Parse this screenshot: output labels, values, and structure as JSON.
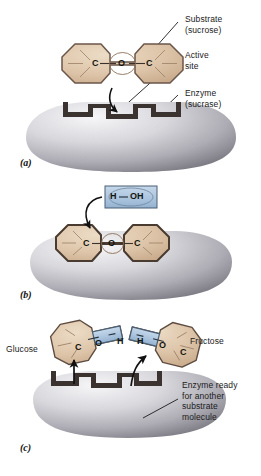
{
  "figure": {
    "background_color": "#ffffff"
  },
  "colors": {
    "substrate_tan": "#dcc2a6",
    "substrate_tan_light": "#e8d6be",
    "substrate_outline": "#6b564a",
    "water_blue": "#a9c3dd",
    "water_blue_light": "#c3d6e9",
    "water_outline": "#4a5f74",
    "enzyme_light": "#f2f1f3",
    "enzyme_mid": "#bdbcc2",
    "enzyme_dark": "#87868e",
    "active_site_dark": "#3a3330",
    "text": "#1b1b1b",
    "arrow": "#111111"
  },
  "panels": [
    {
      "id": "a",
      "tag": "(a)",
      "labels": [
        {
          "name": "substrate",
          "line1": "Substrate",
          "line2": "(sucrose)"
        },
        {
          "name": "active-site",
          "line1": "Active",
          "line2": "site"
        },
        {
          "name": "enzyme",
          "line1": "Enzyme",
          "line2": "(sucrase)"
        }
      ],
      "molecule": {
        "name": "sucrose",
        "atoms": [
          "C",
          "O",
          "C"
        ],
        "rings": 2
      }
    },
    {
      "id": "b",
      "tag": "(b)",
      "water": {
        "name": "water",
        "atoms": [
          "H",
          "OH"
        ],
        "formula": "H—OH"
      },
      "molecule": {
        "name": "sucrose-bound",
        "atoms": [
          "C",
          "O",
          "C"
        ],
        "rings": 2
      }
    },
    {
      "id": "c",
      "tag": "(c)",
      "labels": [
        {
          "name": "glucose",
          "line1": "Glucose"
        },
        {
          "name": "fructose",
          "line1": "Fructose"
        },
        {
          "name": "enzyme-ready",
          "line1": "Enzyme ready",
          "line2": "for another",
          "line3": "substrate",
          "line4": "molecule"
        }
      ],
      "products": {
        "glucose_atoms": [
          "C",
          "O",
          "H"
        ],
        "fructose_atoms": [
          "H",
          "O",
          "C"
        ]
      }
    }
  ],
  "atoms": {
    "a_c_left": "C",
    "a_o_mid": "O",
    "a_c_right": "C",
    "b_c_left": "C",
    "b_o_mid": "O",
    "b_c_right": "C",
    "b_water_h": "H",
    "b_water_oh": "OH",
    "c_glucose_c": "C",
    "c_glucose_o": "O",
    "c_glucose_h": "H",
    "c_fructose_h": "H",
    "c_fructose_o": "O",
    "c_fructose_c": "C"
  },
  "tags": {
    "a": "(a)",
    "b": "(b)",
    "c": "(c)"
  },
  "text": {
    "substrate_l1": "Substrate",
    "substrate_l2": "(sucrose)",
    "active_l1": "Active",
    "active_l2": "site",
    "enzyme_l1": "Enzyme",
    "enzyme_l2": "(sucrase)",
    "glucose": "Glucose",
    "fructose": "Fructose",
    "ready_l1": "Enzyme ready",
    "ready_l2": "for another",
    "ready_l3": "substrate",
    "ready_l4": "molecule"
  }
}
